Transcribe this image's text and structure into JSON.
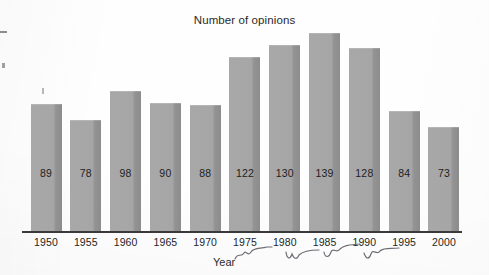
{
  "chart_data": {
    "type": "bar",
    "title": "Number of opinions",
    "xlabel": "Year",
    "ylabel": "",
    "categories": [
      "1950",
      "1955",
      "1960",
      "1965",
      "1970",
      "1975",
      "1980",
      "1985",
      "1990",
      "1995",
      "2000"
    ],
    "values": [
      89,
      78,
      98,
      90,
      88,
      122,
      130,
      139,
      128,
      84,
      73
    ],
    "ylim": [
      0,
      145
    ],
    "grid": false,
    "legend": null,
    "axis_ticks_visible": false,
    "bar_labels_inside": true,
    "annotations": [
      {
        "name": "pen-squiggle-under-1975",
        "kind": "handwritten-mark",
        "text": ""
      },
      {
        "name": "pen-squiggle-under-1980",
        "kind": "handwritten-mark",
        "text": ""
      },
      {
        "name": "pen-squiggle-under-1985",
        "kind": "handwritten-mark",
        "text": ""
      },
      {
        "name": "pen-squiggle-under-1990",
        "kind": "handwritten-mark",
        "text": ""
      }
    ]
  },
  "colors": {
    "bar_fill": "#a7a7a7",
    "bar_shadow_edge": "#8c8c8c",
    "axis_line": "#3a3a3a",
    "text": "#1f1f1f",
    "background": "#fefefe",
    "pen_ink": "#6d6d74"
  },
  "bars": [
    {
      "year": "1950",
      "value": 89,
      "label": "89"
    },
    {
      "year": "1955",
      "value": 78,
      "label": "78"
    },
    {
      "year": "1960",
      "value": 98,
      "label": "98"
    },
    {
      "year": "1965",
      "value": 90,
      "label": "90"
    },
    {
      "year": "1970",
      "value": 88,
      "label": "88"
    },
    {
      "year": "1975",
      "value": 122,
      "label": "122"
    },
    {
      "year": "1980",
      "value": 130,
      "label": "130"
    },
    {
      "year": "1985",
      "value": 139,
      "label": "139"
    },
    {
      "year": "1990",
      "value": 128,
      "label": "128"
    },
    {
      "year": "1995",
      "value": 84,
      "label": "84"
    },
    {
      "year": "2000",
      "value": 73,
      "label": "73"
    }
  ],
  "labels": {
    "title": "Number of opinions",
    "x_axis_title": "Year"
  }
}
